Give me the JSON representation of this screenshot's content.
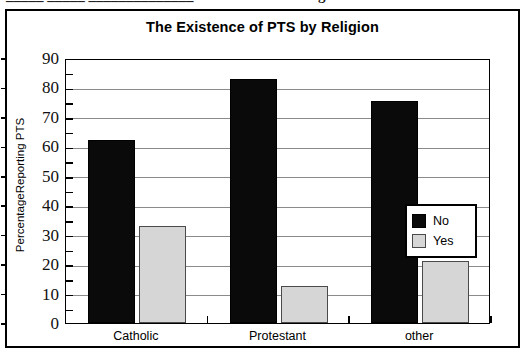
{
  "artifact": {
    "left_fragment": "_____  _____  ______________",
    "right_fragment": "g"
  },
  "chart_data": {
    "type": "bar",
    "title": "The Existence of PTS by Religion",
    "xlabel": "",
    "ylabel": "PercentageReporting PTS",
    "categories": [
      "Catholic",
      "Protestant",
      "other"
    ],
    "series": [
      {
        "name": "No",
        "color": "#0a0a0a",
        "values": [
          62,
          83,
          75.5
        ]
      },
      {
        "name": "Yes",
        "color": "#d6d6d6",
        "values": [
          33,
          12.5,
          21
        ]
      }
    ],
    "ylim": [
      0,
      90
    ],
    "ytick_step": 10,
    "yticks": [
      "0",
      "10",
      "20",
      "30",
      "40",
      "50",
      "60",
      "70",
      "80",
      "90"
    ],
    "grid": true,
    "legend_position": "center-right",
    "legend_entries": [
      "No",
      "Yes"
    ]
  }
}
